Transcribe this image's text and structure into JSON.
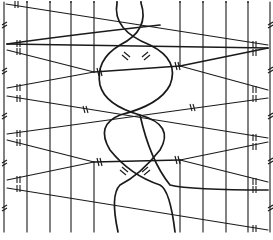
{
  "diagram": {
    "title": "",
    "type": "bobbin-lace-pricking",
    "width": 273,
    "height": 240,
    "ink_color": "#1a1a1a",
    "background": "#ffffff",
    "pins_top_x": [
      15,
      27,
      50,
      71,
      94,
      117,
      141,
      180,
      203,
      226,
      248,
      270
    ],
    "vertical_threads_x": [
      27,
      50,
      71,
      94,
      180,
      203,
      226,
      248
    ],
    "left_edge_x": 4,
    "right_edge_x": 270
  }
}
